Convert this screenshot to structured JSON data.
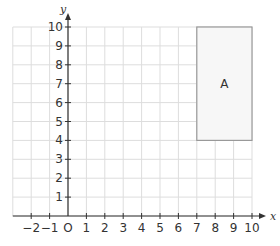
{
  "diagram": {
    "type": "coordinate-grid",
    "axes": {
      "x_label": "x",
      "y_label": "y",
      "x_range": [
        -3,
        10
      ],
      "y_range": [
        0,
        10
      ],
      "x_ticks": [
        "−2",
        "−1",
        "O",
        "1",
        "2",
        "3",
        "4",
        "5",
        "6",
        "7",
        "8",
        "9",
        "10"
      ],
      "x_tick_values": [
        -2,
        -1,
        0,
        1,
        2,
        3,
        4,
        5,
        6,
        7,
        8,
        9,
        10
      ],
      "y_ticks": [
        "1",
        "2",
        "3",
        "4",
        "5",
        "6",
        "7",
        "8",
        "9",
        "10"
      ],
      "y_tick_values": [
        1,
        2,
        3,
        4,
        5,
        6,
        7,
        8,
        9,
        10
      ]
    },
    "shapes": [
      {
        "label": "A",
        "type": "rectangle",
        "x_min": 7,
        "x_max": 10,
        "y_min": 4,
        "y_max": 10,
        "fill": "#f7f7f7",
        "stroke": "#999999"
      }
    ],
    "colors": {
      "grid": "#dddddd",
      "axis": "#333333"
    }
  }
}
